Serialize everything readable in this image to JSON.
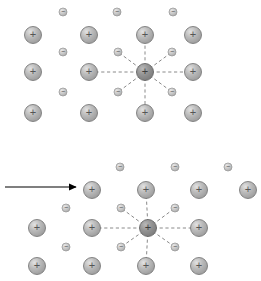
{
  "figure": {
    "title": "",
    "background_color": "#ffffff",
    "width": 261,
    "height": 281
  },
  "colors": {
    "ion_fill_light": "#d8d8d8",
    "ion_fill_mid": "#a8a8a8",
    "ion_fill_dark": "#8f8f8f",
    "ion_stroke": "#7a7a7a",
    "ion_sign": "#555555",
    "ion_highlight_fill": "#8c8c8c",
    "ion_highlight_stroke": "#6a6a6a",
    "electron_fill": "#c9c9c9",
    "electron_stroke": "#9a9a9a",
    "electron_sign": "#4a4a4a",
    "dashed_line": "#8a8a8a",
    "arrow_color": "#000000"
  },
  "glyphs": {
    "ion_label": "+",
    "electron_label": "−"
  },
  "sizes": {
    "ion_radius": 8.5,
    "ion_highlight_radius": 8.5,
    "electron_radius": 4.0
  },
  "panels": [
    {
      "name": "undisplaced-lattice",
      "label": "",
      "arrow": null,
      "ions": [
        {
          "id": "p1-ion-r1c1",
          "x": 33,
          "y": 35,
          "highlight": false
        },
        {
          "id": "p1-ion-r1c2",
          "x": 89,
          "y": 35,
          "highlight": false
        },
        {
          "id": "p1-ion-r1c3",
          "x": 145,
          "y": 35,
          "highlight": false
        },
        {
          "id": "p1-ion-r1c4",
          "x": 193,
          "y": 35,
          "highlight": false
        },
        {
          "id": "p1-ion-r2c1",
          "x": 33,
          "y": 72,
          "highlight": false
        },
        {
          "id": "p1-ion-r2c2",
          "x": 89,
          "y": 72,
          "highlight": false
        },
        {
          "id": "p1-ion-r2c3",
          "x": 145,
          "y": 72,
          "highlight": true
        },
        {
          "id": "p1-ion-r2c4",
          "x": 193,
          "y": 72,
          "highlight": false
        },
        {
          "id": "p1-ion-r3c1",
          "x": 33,
          "y": 113,
          "highlight": false
        },
        {
          "id": "p1-ion-r3c2",
          "x": 89,
          "y": 113,
          "highlight": false
        },
        {
          "id": "p1-ion-r3c3",
          "x": 145,
          "y": 113,
          "highlight": false
        },
        {
          "id": "p1-ion-r3c4",
          "x": 193,
          "y": 113,
          "highlight": false
        }
      ],
      "electrons": [
        {
          "id": "p1-e-top-1",
          "x": 63,
          "y": 12
        },
        {
          "id": "p1-e-top-2",
          "x": 117,
          "y": 12
        },
        {
          "id": "p1-e-top-3",
          "x": 173,
          "y": 12
        },
        {
          "id": "p1-e-mid-1",
          "x": 63,
          "y": 52
        },
        {
          "id": "p1-e-bot-1",
          "x": 63,
          "y": 92
        },
        {
          "id": "p1-e-diag-nw",
          "x": 118,
          "y": 52
        },
        {
          "id": "p1-e-diag-ne",
          "x": 172,
          "y": 52
        },
        {
          "id": "p1-e-diag-sw",
          "x": 118,
          "y": 92
        },
        {
          "id": "p1-e-diag-se",
          "x": 172,
          "y": 92
        }
      ],
      "field_lines": [
        {
          "id": "p1-line-w",
          "x1": 145,
          "y1": 72,
          "x2": 89,
          "y2": 72
        },
        {
          "id": "p1-line-e",
          "x1": 145,
          "y1": 72,
          "x2": 193,
          "y2": 72
        },
        {
          "id": "p1-line-n",
          "x1": 145,
          "y1": 72,
          "x2": 145,
          "y2": 35
        },
        {
          "id": "p1-line-s",
          "x1": 145,
          "y1": 72,
          "x2": 145,
          "y2": 113
        },
        {
          "id": "p1-line-nw",
          "x1": 145,
          "y1": 72,
          "x2": 118,
          "y2": 52
        },
        {
          "id": "p1-line-ne",
          "x1": 145,
          "y1": 72,
          "x2": 172,
          "y2": 52
        },
        {
          "id": "p1-line-sw",
          "x1": 145,
          "y1": 72,
          "x2": 118,
          "y2": 92
        },
        {
          "id": "p1-line-se",
          "x1": 145,
          "y1": 72,
          "x2": 172,
          "y2": 92
        }
      ]
    },
    {
      "name": "displaced-lattice",
      "label": "",
      "arrow": {
        "id": "drift-arrow",
        "x1": 5,
        "y1": 187,
        "x2": 76,
        "y2": 187,
        "direction": "right"
      },
      "ions": [
        {
          "id": "p2-ion-r1c1",
          "x": 92,
          "y": 190,
          "highlight": false
        },
        {
          "id": "p2-ion-r1c2",
          "x": 146,
          "y": 190,
          "highlight": false
        },
        {
          "id": "p2-ion-r1c3",
          "x": 199,
          "y": 190,
          "highlight": false
        },
        {
          "id": "p2-ion-r1c4",
          "x": 248,
          "y": 190,
          "highlight": false
        },
        {
          "id": "p2-ion-r2c0",
          "x": 37,
          "y": 228,
          "highlight": false
        },
        {
          "id": "p2-ion-r2c1",
          "x": 92,
          "y": 228,
          "highlight": false
        },
        {
          "id": "p2-ion-r2c2",
          "x": 148,
          "y": 228,
          "highlight": true
        },
        {
          "id": "p2-ion-r2c3",
          "x": 199,
          "y": 228,
          "highlight": false
        },
        {
          "id": "p2-ion-r3c0",
          "x": 37,
          "y": 266,
          "highlight": false
        },
        {
          "id": "p2-ion-r3c1",
          "x": 92,
          "y": 266,
          "highlight": false
        },
        {
          "id": "p2-ion-r3c2",
          "x": 146,
          "y": 266,
          "highlight": false
        },
        {
          "id": "p2-ion-r3c3",
          "x": 199,
          "y": 266,
          "highlight": false
        }
      ],
      "electrons": [
        {
          "id": "p2-e-top-1",
          "x": 120,
          "y": 167
        },
        {
          "id": "p2-e-top-2",
          "x": 175,
          "y": 167
        },
        {
          "id": "p2-e-top-3",
          "x": 228,
          "y": 167
        },
        {
          "id": "p2-e-mid-1",
          "x": 66,
          "y": 208
        },
        {
          "id": "p2-e-bot-1",
          "x": 66,
          "y": 247
        },
        {
          "id": "p2-e-diag-nw",
          "x": 121,
          "y": 208
        },
        {
          "id": "p2-e-diag-ne",
          "x": 175,
          "y": 208
        },
        {
          "id": "p2-e-diag-sw",
          "x": 121,
          "y": 247
        },
        {
          "id": "p2-e-diag-se",
          "x": 175,
          "y": 247
        }
      ],
      "field_lines": [
        {
          "id": "p2-line-w",
          "x1": 148,
          "y1": 228,
          "x2": 92,
          "y2": 228
        },
        {
          "id": "p2-line-e",
          "x1": 148,
          "y1": 228,
          "x2": 199,
          "y2": 228
        },
        {
          "id": "p2-line-n",
          "x1": 148,
          "y1": 228,
          "x2": 146,
          "y2": 190
        },
        {
          "id": "p2-line-s",
          "x1": 148,
          "y1": 228,
          "x2": 146,
          "y2": 266
        },
        {
          "id": "p2-line-nw",
          "x1": 148,
          "y1": 228,
          "x2": 121,
          "y2": 208
        },
        {
          "id": "p2-line-ne",
          "x1": 148,
          "y1": 228,
          "x2": 175,
          "y2": 208
        },
        {
          "id": "p2-line-sw",
          "x1": 148,
          "y1": 228,
          "x2": 121,
          "y2": 247
        },
        {
          "id": "p2-line-se",
          "x1": 148,
          "y1": 228,
          "x2": 175,
          "y2": 247
        }
      ]
    }
  ]
}
